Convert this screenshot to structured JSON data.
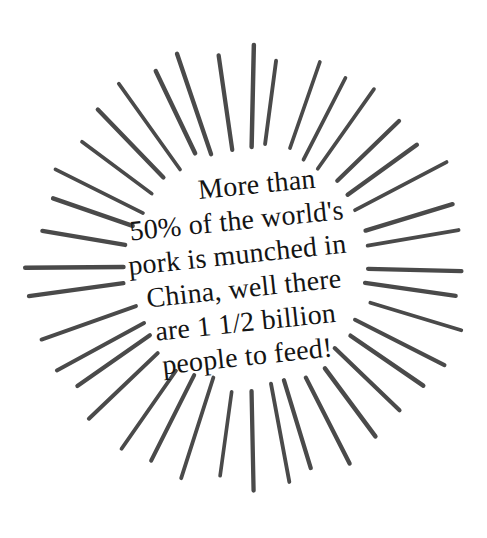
{
  "graphic": {
    "kind": "sunburst-fact-callout",
    "background_color": "#ffffff",
    "burst": {
      "name": "starburst-rays",
      "ray_color": "#4a4a4a",
      "ray_count": 40,
      "ray_width_px": 4,
      "center_x": 249,
      "center_y": 266,
      "inner_radius_px": 122,
      "outer_radius_px": 216,
      "start_angle_deg": -90
    },
    "text_color": "#141414",
    "rotation_deg": -6.2
  },
  "caption": {
    "name": "fact-text",
    "full_text": "More than 50% of the world's pork is munched in China, well there are 1 1/2 billion people to feed!",
    "lines": [
      "More than",
      "50% of the world's",
      "pork is munched in",
      "China, well there",
      "are 1 1/2 billion",
      "people to feed!"
    ]
  }
}
